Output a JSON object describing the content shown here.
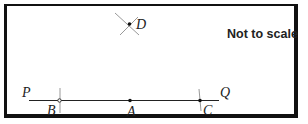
{
  "diagram": {
    "note": "Not to scale",
    "line": {
      "start_label": "P",
      "end_label": "Q"
    },
    "points": {
      "A": {
        "label": "A"
      },
      "B": {
        "label": "B"
      },
      "C": {
        "label": "C"
      },
      "D": {
        "label": "D"
      }
    },
    "colors": {
      "line": "#222222",
      "arc": "#999999",
      "frame": "#111111"
    }
  }
}
